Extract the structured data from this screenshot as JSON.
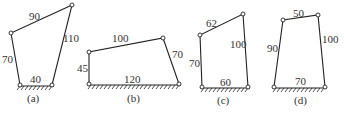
{
  "figures": [
    {
      "id": "a",
      "caption": "(a)",
      "links": {
        "top": "90",
        "left": "70",
        "right": "110",
        "ground": "40"
      },
      "pivots": {
        "bl": [
          20,
          85
        ],
        "br": [
          52,
          85
        ],
        "tl": [
          11,
          33
        ],
        "tr": [
          72,
          5
        ]
      }
    },
    {
      "id": "b",
      "caption": "(b)",
      "links": {
        "top": "100",
        "left": "45",
        "right": "70",
        "ground": "120"
      },
      "pivots": {
        "bl": [
          89,
          84
        ],
        "br": [
          179,
          84
        ],
        "tl": [
          89,
          52
        ],
        "tr": [
          163,
          38
        ]
      }
    },
    {
      "id": "c",
      "caption": "(c)",
      "links": {
        "top": "62",
        "left": "70",
        "right": "100",
        "ground": "60"
      },
      "pivots": {
        "bl": [
          202,
          87
        ],
        "br": [
          248,
          87
        ],
        "tl": [
          200,
          35
        ],
        "tr": [
          243,
          14
        ]
      }
    },
    {
      "id": "d",
      "caption": "(d)",
      "links": {
        "top": "50",
        "left": "90",
        "right": "100",
        "ground": "70"
      },
      "pivots": {
        "bl": [
          274,
          87
        ],
        "br": [
          325,
          87
        ],
        "tl": [
          283,
          20
        ],
        "tr": [
          318,
          15
        ]
      }
    }
  ]
}
